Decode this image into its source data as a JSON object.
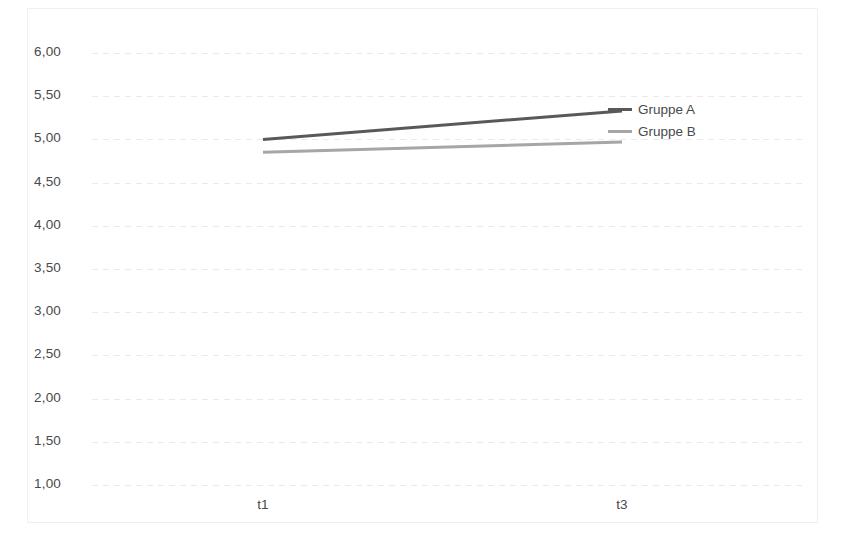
{
  "chart_data": {
    "type": "line",
    "title": "",
    "subtitle": "",
    "xlabel": "",
    "ylabel": "",
    "categories": [
      "t1",
      "t3"
    ],
    "x_tick_labels": [
      "t1",
      "t3"
    ],
    "y_tick_labels": [
      "6,00",
      "5,50",
      "5,00",
      "4,50",
      "4,00",
      "3,50",
      "3,00",
      "2,50",
      "2,00",
      "1,50",
      "1,00"
    ],
    "y_ticks": [
      6.0,
      5.5,
      5.0,
      4.5,
      4.0,
      3.5,
      3.0,
      2.5,
      2.0,
      1.5,
      1.0
    ],
    "ylim": [
      1.0,
      6.0
    ],
    "y_tick_step": 0.5,
    "grid": true,
    "grid_style": "dotted-horizontal",
    "grid_color": "#e9e9e9",
    "legend_position": "inside-right",
    "series": [
      {
        "name": "Gruppe A",
        "values": [
          5.0,
          5.33
        ],
        "color": "#595959",
        "line_width": 3
      },
      {
        "name": "Gruppe B",
        "values": [
          4.85,
          4.97
        ],
        "color": "#a6a6a6",
        "line_width": 3
      }
    ],
    "legend": [
      {
        "label": "Gruppe A",
        "color": "#595959"
      },
      {
        "label": "Gruppe B",
        "color": "#a6a6a6"
      }
    ],
    "annotations": [],
    "background_color": "#ffffff",
    "border_color": "#f0f0f0",
    "tick_label_color": "#4a4a4a"
  }
}
